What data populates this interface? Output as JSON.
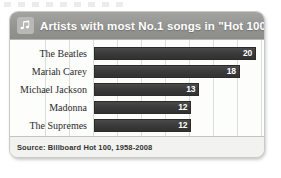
{
  "card": {
    "header": {
      "icon": "music-note-icon",
      "title": "Artists with most No.1 songs in \"Hot 100\""
    },
    "footer": {
      "source": "Source: Billboard Hot 100, 1958-2008"
    }
  },
  "colors": {
    "header_band": "#949491",
    "bar_fill": "#3a3a3a",
    "value_label": "#ffffff",
    "card_background": "#fbfbfa",
    "footer_band": "#f2f2f0",
    "gridline": "#bcc7bc"
  },
  "chart_data": {
    "type": "bar",
    "orientation": "horizontal",
    "title": "Artists with most No.1 songs in \"Hot 100\"",
    "xlabel": "",
    "ylabel": "",
    "categories": [
      "The Beatles",
      "Mariah Carey",
      "Michael Jackson",
      "Madonna",
      "The Supremes"
    ],
    "values": [
      20,
      18,
      13,
      12,
      12
    ],
    "value_labels": [
      "20",
      "18",
      "13",
      "12",
      "12"
    ],
    "xlim": [
      0,
      20
    ],
    "grid": true,
    "legend": false,
    "source": "Source: Billboard Hot 100, 1958-2008"
  }
}
